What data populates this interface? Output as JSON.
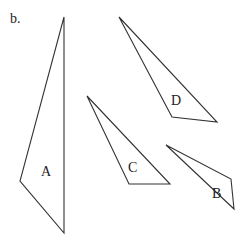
{
  "part_label": "b.",
  "stroke_color": "#333333",
  "shapes": [
    {
      "id": "A",
      "label": "A",
      "points": "64,17 20,181 64,233",
      "label_pos": [
        46,
        172
      ]
    },
    {
      "id": "D",
      "label": "D",
      "points": "119,17 172,117 217,122",
      "label_pos": [
        177,
        105
      ]
    },
    {
      "id": "C",
      "label": "C",
      "points": "87,96 129,184 170,184",
      "label_pos": [
        133,
        172
      ]
    },
    {
      "id": "B",
      "label": "B",
      "points": "166,145 231,179 234,209",
      "label_pos": [
        217,
        198
      ]
    }
  ]
}
